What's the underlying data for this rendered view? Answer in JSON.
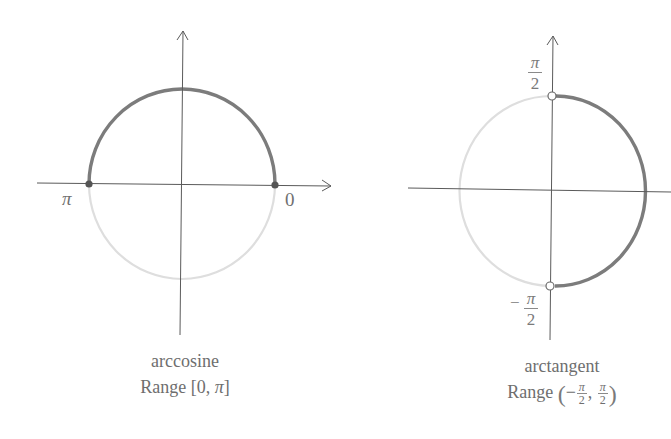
{
  "figures": [
    {
      "id": "arccosine",
      "title": "arccosine",
      "range_label": "Range [0, π]",
      "range_prefix": "Range",
      "range_open": "[",
      "range_low": "0",
      "range_sep": ",",
      "range_high": "π",
      "range_close": "]",
      "endpoint_labels": {
        "left": "π",
        "right": "0"
      },
      "highlighted_arc": "upper semicircle from 0 to π",
      "endpoints": "closed (filled dots)"
    },
    {
      "id": "arctangent",
      "title": "arctangent",
      "range_label": "Range (−π/2, π/2)",
      "range_prefix": "Range",
      "range_open": "(",
      "range_low_sign": "−",
      "range_low_num": "π",
      "range_low_den": "2",
      "range_sep": ",",
      "range_high_num": "π",
      "range_high_den": "2",
      "range_close": ")",
      "endpoint_labels": {
        "top_num": "π",
        "top_den": "2",
        "bottom_sign": "−",
        "bottom_num": "π",
        "bottom_den": "2"
      },
      "highlighted_arc": "right semicircle from −π/2 to π/2",
      "endpoints": "open (hollow circles)"
    }
  ],
  "colors": {
    "axis": "#555555",
    "highlight_arc": "#7a7a7a",
    "faded_arc": "#dcdcdc",
    "text": "#707070"
  }
}
